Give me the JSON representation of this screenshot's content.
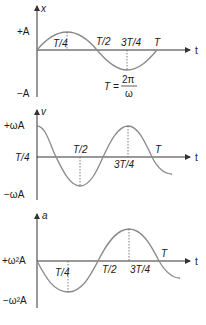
{
  "graphs": [
    {
      "id": "displacement",
      "y_label": "x",
      "x_label": "t",
      "y_pos_label": "+A",
      "y_neg_label": "−A",
      "ticks": {
        "q1": "T/4",
        "half": "T/2",
        "q3": "3T/4",
        "full": "T"
      },
      "formula": {
        "lhs": "T =",
        "num": "2π",
        "den": "ω"
      }
    },
    {
      "id": "velocity",
      "y_label": "v",
      "x_label": "t",
      "y_pos_label": "+ωA",
      "y_zero_label": "T/4",
      "y_neg_label": "−ωA",
      "ticks": {
        "half": "T/2",
        "q3": "3T/4",
        "full": "T"
      }
    },
    {
      "id": "acceleration",
      "y_label": "a",
      "x_label": "t",
      "y_pos_label": "+ω²A",
      "y_neg_label": "−ω²A",
      "ticks": {
        "q1": "T/4",
        "half": "T/2",
        "q3": "3T/4",
        "full": "T"
      }
    }
  ],
  "colors": {
    "curve": "#8a8a8a",
    "axis": "#333333",
    "text": "#1a1a1a"
  }
}
